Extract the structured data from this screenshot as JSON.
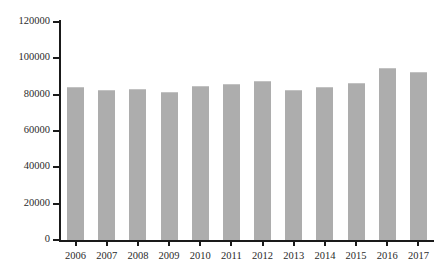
{
  "chart_data": {
    "type": "bar",
    "title": "",
    "subtitle": "",
    "xlabel": "",
    "ylabel": "",
    "categories": [
      "2006",
      "2007",
      "2008",
      "2009",
      "2010",
      "2011",
      "2012",
      "2013",
      "2014",
      "2015",
      "2016",
      "2017"
    ],
    "values": [
      84000,
      82800,
      83400,
      81700,
      84900,
      85800,
      87500,
      82800,
      84300,
      86500,
      94500,
      92700
    ],
    "series": [
      {
        "name": "",
        "values": [
          84000,
          82800,
          83400,
          81700,
          84900,
          85800,
          87500,
          82800,
          84300,
          86500,
          94500,
          92700
        ]
      }
    ],
    "ylim": [
      0,
      120000
    ],
    "y_ticks": [
      0,
      20000,
      40000,
      60000,
      80000,
      100000,
      120000
    ],
    "y_tick_labels": [
      "0",
      "20000",
      "40000",
      "60000",
      "80000",
      "100000",
      "120000"
    ],
    "grid": false,
    "legend": false,
    "legend_position": "none",
    "bar_color": "#adadad",
    "axis_color": "#1a1a1a",
    "background_color": "#ffffff"
  }
}
